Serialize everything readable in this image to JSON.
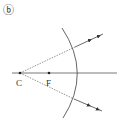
{
  "figure": {
    "panel_label": "ⓑ",
    "points": {
      "center_label": "C",
      "focus_label": "F"
    },
    "colors": {
      "line": "#555555",
      "ray": "#555555",
      "background": "#ffffff"
    }
  }
}
